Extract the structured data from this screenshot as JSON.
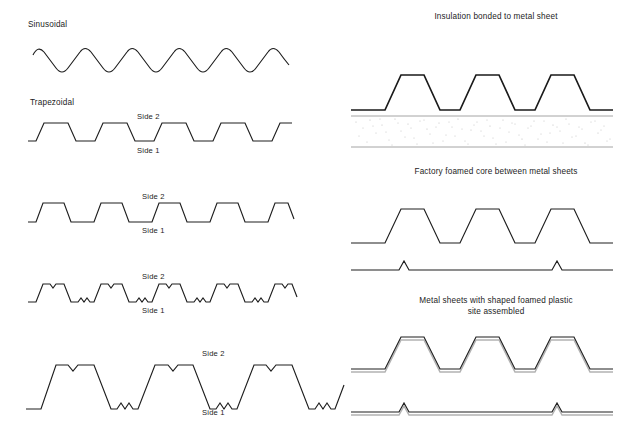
{
  "figure": {
    "title_alt": "Profiled metal sheet and insulated panel cross-sections",
    "background": "#ffffff",
    "line_color": "#1e1e1e",
    "accent_grey": "#9a9a9a"
  },
  "left_column": {
    "headings": [
      {
        "id": "sinusoidal",
        "text": "Sinusoidal",
        "x": 28,
        "y": 20
      },
      {
        "id": "trapezoidal",
        "text": "Trapezoidal",
        "x": 30,
        "y": 98
      }
    ],
    "profiles": [
      {
        "id": "profile-sinusoidal",
        "type": "sinusoidal",
        "cycles": 6,
        "side_labels": []
      },
      {
        "id": "profile-trapezoidal-1",
        "type": "trapezoidal-plain",
        "cycles": 5,
        "side_labels": [
          {
            "text": "Side 2",
            "x": 137,
            "y": 112
          },
          {
            "text": "Side 1",
            "x": 137,
            "y": 146
          }
        ]
      },
      {
        "id": "profile-trapezoidal-2",
        "type": "trapezoidal-plain",
        "cycles": 5,
        "side_labels": [
          {
            "text": "Side 2",
            "x": 142,
            "y": 192
          },
          {
            "text": "Side 1",
            "x": 142,
            "y": 226
          }
        ]
      },
      {
        "id": "profile-trapezoidal-stiffened",
        "type": "trapezoidal-stiffened",
        "cycles": 5,
        "side_labels": [
          {
            "text": "Side 2",
            "x": 142,
            "y": 272
          },
          {
            "text": "Side 1",
            "x": 142,
            "y": 306
          }
        ]
      },
      {
        "id": "profile-deep-deck",
        "type": "deep-deck-stiffened",
        "cycles": 3,
        "side_labels": [
          {
            "text": "Side 2",
            "x": 202,
            "y": 349
          },
          {
            "text": "Side 1",
            "x": 202,
            "y": 408
          }
        ]
      }
    ]
  },
  "right_column": {
    "captions": [
      {
        "id": "caption-insulation-bonded",
        "lines": [
          "Insulation bonded to metal sheet"
        ],
        "cx": 496,
        "y": 12
      },
      {
        "id": "caption-factory-foamed-core",
        "lines": [
          "Factory foamed core between metal sheets"
        ],
        "cx": 496,
        "y": 167
      },
      {
        "id": "caption-site-assembled",
        "lines": [
          "Metal sheets with shaped foamed plastic",
          "site assembled"
        ],
        "cx": 496,
        "y": 296
      }
    ],
    "panels": [
      {
        "id": "panel-insulation-bonded",
        "type": "profiled-sheet-over-foam-core",
        "ribs": 3,
        "core_texture": "speckled-foam"
      },
      {
        "id": "panel-factory-foamed",
        "type": "profiled-sheet-and-flat-sheet",
        "ribs": 3,
        "bottom_sheet_bumps": 2
      },
      {
        "id": "panel-site-assembled",
        "type": "double-line-profiled-sheet-and-flat-sheet",
        "ribs": 3,
        "bottom_sheet_bumps": 2
      }
    ]
  }
}
